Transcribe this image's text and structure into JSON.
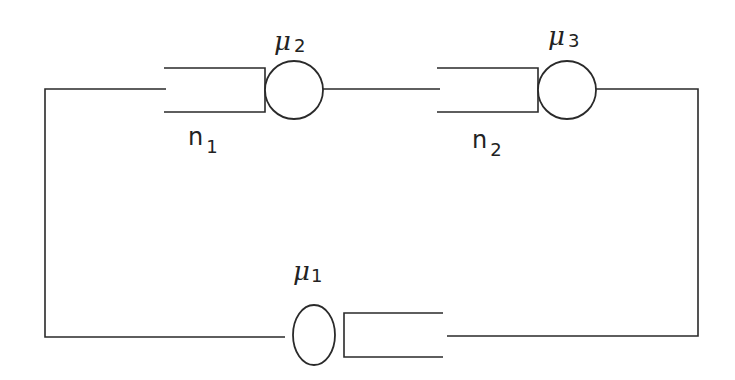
{
  "diagram": {
    "title": "",
    "type": "closed queueing network",
    "colors": {
      "line": "#2a2a2a",
      "background": "#ffffff"
    },
    "stations": [
      {
        "id": "station-1",
        "rate_symbol": "μ",
        "rate_sub": "1",
        "position": "bottom"
      },
      {
        "id": "station-2",
        "rate_symbol": "μ",
        "rate_sub": "2",
        "queue_symbol": "n",
        "queue_sub": "1",
        "position": "top-left"
      },
      {
        "id": "station-3",
        "rate_symbol": "μ",
        "rate_sub": "3",
        "queue_symbol": "n",
        "queue_sub": "2",
        "position": "top-right"
      }
    ],
    "labels": {
      "mu1": {
        "sym": "μ",
        "sub": "1"
      },
      "mu2": {
        "sym": "μ",
        "sub": "2"
      },
      "mu3": {
        "sym": "μ",
        "sub": "3"
      },
      "n1": {
        "sym": "n",
        "sub": "1"
      },
      "n2": {
        "sym": "n",
        "sub": "2"
      }
    }
  }
}
